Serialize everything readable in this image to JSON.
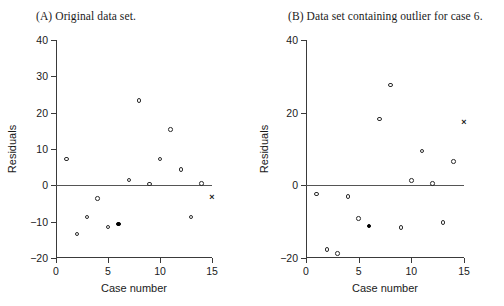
{
  "figure": {
    "panels": [
      {
        "id": "A",
        "title": "(A) Original data set.",
        "xlabel": "Case number",
        "ylabel": "Residuals"
      },
      {
        "id": "B",
        "title": "(B) Data set containing outlier for case 6.",
        "xlabel": "Case number",
        "ylabel": "Residuals"
      }
    ]
  },
  "chart_data": [
    {
      "type": "scatter",
      "title": "(A) Original data set.",
      "xlabel": "Case number",
      "ylabel": "Residuals",
      "xlim": [
        0,
        15
      ],
      "ylim": [
        -20,
        40
      ],
      "xticks": [
        0,
        5,
        10,
        15
      ],
      "yticks": [
        -20,
        -10,
        0,
        10,
        20,
        30,
        40
      ],
      "grid": false,
      "legend": "none",
      "zero_reference_line": 0,
      "series": [
        {
          "name": "residuals-open",
          "marker": "open-circle",
          "points": [
            {
              "x": 1,
              "y": 7.2
            },
            {
              "x": 2,
              "y": -13.4
            },
            {
              "x": 3,
              "y": -8.7
            },
            {
              "x": 4,
              "y": -3.6
            },
            {
              "x": 5,
              "y": -11.5
            },
            {
              "x": 7,
              "y": 1.5
            },
            {
              "x": 8,
              "y": 23.3
            },
            {
              "x": 9,
              "y": 0.3
            },
            {
              "x": 10,
              "y": 7.2
            },
            {
              "x": 11,
              "y": 15.3
            },
            {
              "x": 12,
              "y": 4.4
            },
            {
              "x": 13,
              "y": -8.7
            },
            {
              "x": 14,
              "y": 0.5
            }
          ]
        },
        {
          "name": "residual-case-6",
          "marker": "filled-circle",
          "points": [
            {
              "x": 6,
              "y": -10.6
            }
          ]
        },
        {
          "name": "residual-case-15",
          "marker": "x-cross",
          "points": [
            {
              "x": 15,
              "y": -3.4
            }
          ]
        }
      ]
    },
    {
      "type": "scatter",
      "title": "(B) Data set containing outlier for case 6.",
      "xlabel": "Case number",
      "ylabel": "Residuals",
      "xlim": [
        0,
        15
      ],
      "ylim": [
        -20,
        40
      ],
      "xticks": [
        0,
        5,
        10,
        15
      ],
      "yticks": [
        -20,
        0,
        20,
        40
      ],
      "grid": false,
      "legend": "none",
      "zero_reference_line": 0,
      "series": [
        {
          "name": "residuals-open",
          "marker": "open-circle",
          "points": [
            {
              "x": 1,
              "y": -2.4
            },
            {
              "x": 2,
              "y": -17.6
            },
            {
              "x": 3,
              "y": -18.7
            },
            {
              "x": 4,
              "y": -3.1
            },
            {
              "x": 5,
              "y": -9.1
            },
            {
              "x": 7,
              "y": 18.2
            },
            {
              "x": 8,
              "y": 27.6
            },
            {
              "x": 9,
              "y": -11.6
            },
            {
              "x": 10,
              "y": 1.3
            },
            {
              "x": 11,
              "y": 9.4
            },
            {
              "x": 12,
              "y": 0.5
            },
            {
              "x": 13,
              "y": -10.2
            },
            {
              "x": 14,
              "y": 6.6
            }
          ]
        },
        {
          "name": "residual-case-6",
          "marker": "filled-circle",
          "points": [
            {
              "x": 6,
              "y": -11.2
            }
          ]
        },
        {
          "name": "residual-case-15",
          "marker": "x-cross",
          "points": [
            {
              "x": 15,
              "y": 17.3
            }
          ]
        }
      ]
    }
  ]
}
